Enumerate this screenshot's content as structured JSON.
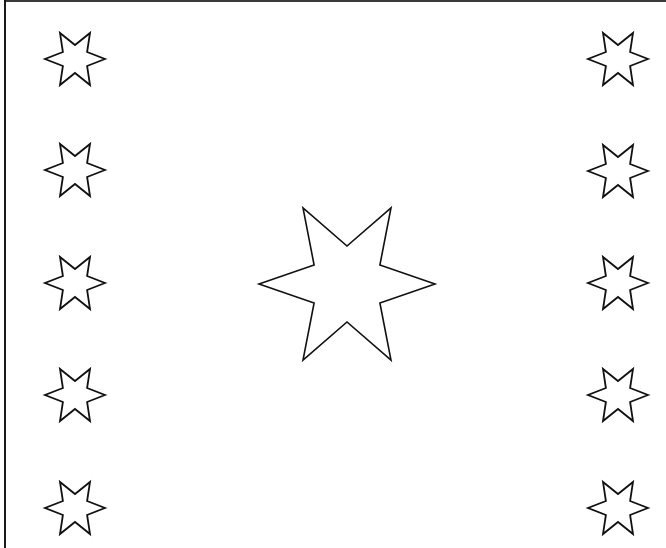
{
  "figure": {
    "width": 666,
    "height": 548,
    "background": "#ffffff",
    "stroke_color": "#111111",
    "border": {
      "left": true,
      "top": true,
      "right": false,
      "bottom": false,
      "color": "#1a1a1a"
    }
  },
  "central_star": {
    "shape": "six-pointed-star-outline",
    "center": [
      347,
      284
    ],
    "outer_radius": 88,
    "inner_radius": 38
  },
  "small_stars": {
    "shape": "six-pointed-star-outline",
    "outer_radius": 30,
    "inner_radius": 14,
    "left_column": {
      "x": 75,
      "ys": [
        59,
        170,
        283,
        395,
        508
      ]
    },
    "right_column": {
      "x": 618,
      "ys": [
        59,
        171,
        283,
        395,
        508
      ]
    }
  }
}
